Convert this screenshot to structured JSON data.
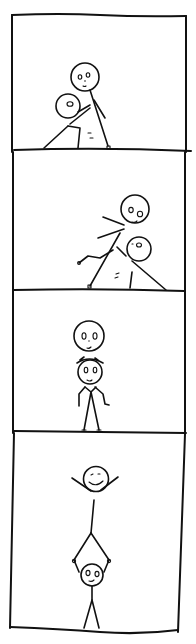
{
  "comic": {
    "title": "Stick figure acrobatics comic",
    "style": "hand-drawn black ink on white",
    "ink_color": "#111111",
    "background_color": "#ffffff",
    "panels": [
      {
        "index": 1,
        "description": "One stick figure crouches on the ground while a second stick figure stands over/on its back"
      },
      {
        "index": 2,
        "description": "The figures tilt; the top figure leans over the crouching figure with arms and legs extended"
      },
      {
        "index": 3,
        "description": "One figure balances its head on top of the other figure's head, both standing"
      },
      {
        "index": 4,
        "description": "Top figure does a handstand on the lower figure's raised hands, arms raised in triumph"
      }
    ]
  }
}
